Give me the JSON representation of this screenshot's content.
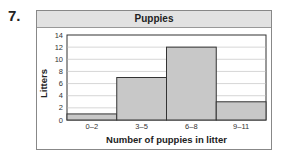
{
  "problem_number": "7.",
  "chart_data": {
    "type": "bar",
    "title": "Puppies",
    "xlabel": "Number of puppies in litter",
    "ylabel": "Litters",
    "categories": [
      "0–2",
      "3–5",
      "6–8",
      "9–11"
    ],
    "values": [
      1,
      7,
      12,
      3
    ],
    "ylim": [
      0,
      14
    ],
    "yticks": [
      0,
      2,
      4,
      6,
      8,
      10,
      12,
      14
    ],
    "grid": true,
    "histogram": true,
    "bar_color": "#c8c8c8"
  }
}
